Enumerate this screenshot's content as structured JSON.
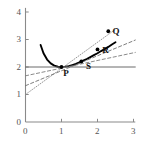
{
  "figure": {
    "background_color": "#ffffff",
    "axis_color": "#8a8a8a",
    "curve_color": "#000000",
    "tangent_color": "#555555",
    "secant_color": "#777777"
  },
  "axes": {
    "x": {
      "ticks": [
        "0",
        "1",
        "2",
        "3"
      ],
      "tick_values": [
        0,
        1,
        2,
        3
      ],
      "min": 0,
      "max": 3.05
    },
    "y": {
      "ticks": [
        "0",
        "1",
        "2",
        "3",
        "4"
      ],
      "tick_values": [
        0,
        1,
        2,
        3,
        4
      ],
      "min": 0,
      "max": 4.15
    }
  },
  "point_labels": [
    {
      "text": "P",
      "x": 1.05,
      "y": 1.78
    },
    {
      "text": "Q",
      "x": 2.42,
      "y": 3.28
    },
    {
      "text": "R",
      "x": 2.13,
      "y": 2.6
    },
    {
      "text": "S",
      "x": 1.68,
      "y": 2.02
    }
  ],
  "chart_data": {
    "type": "line",
    "title": "",
    "xlabel": "",
    "ylabel": "",
    "xlim": [
      0,
      3.05
    ],
    "ylim": [
      0,
      4.15
    ],
    "grid": false,
    "legend": "none",
    "series": [
      {
        "name": "curve",
        "role": "function-curve",
        "style": "solid-thick",
        "color": "#000000",
        "x": [
          0.42,
          0.5,
          0.6,
          0.7,
          0.8,
          0.9,
          1.0,
          1.1,
          1.2,
          1.3,
          1.4,
          1.5,
          1.6,
          1.7,
          1.8,
          1.9,
          2.0,
          2.1,
          2.2,
          2.3,
          2.4,
          2.5
        ],
        "values": [
          2.8,
          2.5,
          2.27,
          2.13,
          2.05,
          2.01,
          2.0,
          2.01,
          2.03,
          2.07,
          2.11,
          2.17,
          2.23,
          2.29,
          2.36,
          2.43,
          2.5,
          2.58,
          2.65,
          2.73,
          2.82,
          2.9
        ]
      },
      {
        "name": "tangent-at-P",
        "role": "horizontal-tangent",
        "style": "solid-thin",
        "color": "#6b6b6b",
        "x": [
          0,
          3.05
        ],
        "values": [
          2.0,
          2.0
        ]
      },
      {
        "name": "secant-PQ",
        "role": "secant",
        "style": "dotted",
        "color": "#8a8a8a",
        "x": [
          0,
          2.55
        ],
        "values": [
          1.0,
          3.42
        ]
      },
      {
        "name": "secant-PR",
        "role": "secant",
        "style": "dashed",
        "color": "#6f6f6f",
        "x": [
          0,
          3.05
        ],
        "values": [
          1.32,
          2.98
        ]
      },
      {
        "name": "secant-PS",
        "role": "secant",
        "style": "dashed",
        "color": "#7d7d7d",
        "x": [
          0,
          3.05
        ],
        "values": [
          1.68,
          2.53
        ]
      }
    ],
    "points": [
      {
        "label": "P",
        "x": 1.0,
        "y": 2.0
      },
      {
        "label": "Q",
        "x": 2.3,
        "y": 3.3
      },
      {
        "label": "R",
        "x": 2.0,
        "y": 2.64
      },
      {
        "label": "S",
        "x": 1.55,
        "y": 2.2
      }
    ]
  }
}
